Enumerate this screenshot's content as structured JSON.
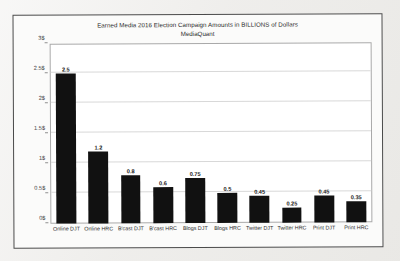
{
  "chart_data": {
    "type": "bar",
    "title": "Earned Media 2016 Election Campaign  Amounts in BILLIONS of Dollars",
    "subtitle": "MediaQuant",
    "xlabel": "",
    "ylabel": "",
    "ylim": [
      0,
      3
    ],
    "grid": true,
    "legend": "none",
    "bar_color": "#111111",
    "categories": [
      "Online DJT",
      "Online HRC",
      "B'cast DJT",
      "B'cast HRC",
      "Blogs DJT",
      "Blogs HRC",
      "Twitter DJT",
      "Twitter HRC",
      "Print DJT",
      "Print HRC"
    ],
    "values": [
      2.5,
      1.2,
      0.8,
      0.6,
      0.75,
      0.5,
      0.45,
      0.25,
      0.45,
      0.35
    ],
    "data_labels": [
      "2.5",
      "1.2",
      "0.8",
      "0.6",
      "0.75",
      "0.5",
      "0.45",
      "0.25",
      "0.45",
      "0.35"
    ],
    "ytick_values": [
      0,
      0.5,
      1,
      1.5,
      2,
      2.5,
      3
    ],
    "ytick_labels": [
      "0$",
      "0.5$",
      "1$",
      "1.5$",
      "2$",
      "2.5$",
      "3$"
    ]
  }
}
